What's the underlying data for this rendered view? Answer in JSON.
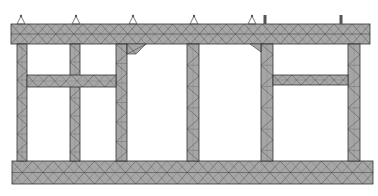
{
  "diagram": {
    "type": "finite-element-mesh",
    "colors": {
      "fill": "#a6a6a6",
      "mesh_line": "#2e2e2e",
      "outline": "#333333",
      "support": "#555555",
      "background": "#ffffff"
    },
    "members": [
      {
        "id": "top-beam",
        "x": 11,
        "y": 24,
        "w": 359,
        "h": 20
      },
      {
        "id": "bottom-beam",
        "x": 12,
        "y": 161,
        "w": 361,
        "h": 23
      },
      {
        "id": "column-1",
        "x": 17,
        "y": 44,
        "w": 10,
        "h": 117
      },
      {
        "id": "column-2",
        "x": 70,
        "y": 44,
        "w": 10,
        "h": 117
      },
      {
        "id": "column-3",
        "x": 116,
        "y": 44,
        "w": 11,
        "h": 117
      },
      {
        "id": "column-4",
        "x": 187,
        "y": 44,
        "w": 12,
        "h": 117
      },
      {
        "id": "column-5",
        "x": 261,
        "y": 44,
        "w": 12,
        "h": 117
      },
      {
        "id": "column-6",
        "x": 348,
        "y": 44,
        "w": 12,
        "h": 117
      },
      {
        "id": "mid-beam-left",
        "x": 27,
        "y": 75,
        "w": 89,
        "h": 12
      },
      {
        "id": "mid-beam-right",
        "x": 273,
        "y": 75,
        "w": 75,
        "h": 10
      }
    ],
    "haunches": [
      {
        "id": "haunch-col3",
        "points": "127,44 146,44 136,54 127,54"
      },
      {
        "id": "haunch-col5",
        "points": "261,44 250,44 261,52"
      }
    ],
    "supports": [
      {
        "id": "support-1",
        "x": 21,
        "kind": "pin"
      },
      {
        "id": "support-2",
        "x": 76,
        "kind": "pin"
      },
      {
        "id": "support-3",
        "x": 133,
        "kind": "pin"
      },
      {
        "id": "support-4",
        "x": 194,
        "kind": "pin"
      },
      {
        "id": "support-5",
        "x": 252,
        "kind": "pin"
      },
      {
        "id": "support-6",
        "x": 265,
        "kind": "post"
      },
      {
        "id": "support-7",
        "x": 341,
        "kind": "post"
      }
    ]
  }
}
